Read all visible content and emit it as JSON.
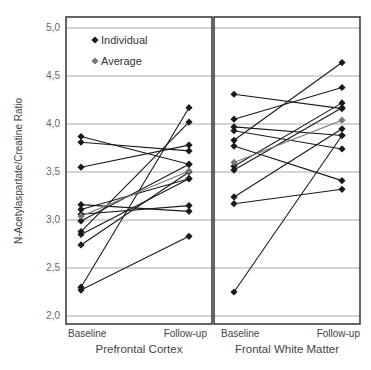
{
  "chart_data": {
    "type": "line",
    "ylabel": "N-Acetylaspartate/Creatine Ratio",
    "ylim": [
      1.95,
      5.1
    ],
    "yticks": [
      "5,0",
      "4,5",
      "4,0",
      "3,5",
      "3,0",
      "2,5",
      "2,0"
    ],
    "ytick_values": [
      5.0,
      4.5,
      4.0,
      3.5,
      3.0,
      2.5,
      2.0
    ],
    "grid": true,
    "legend": {
      "position": "upper-left",
      "entries": [
        {
          "label": "Individual",
          "color": "#1a1a1a"
        },
        {
          "label": "Average",
          "color": "#777777"
        }
      ]
    },
    "panels": [
      {
        "title": "Prefrontal Cortex",
        "categories": [
          "Baseline",
          "Follow-up"
        ],
        "individuals": [
          [
            3.87,
            3.58
          ],
          [
            3.81,
            3.72
          ],
          [
            3.55,
            3.78
          ],
          [
            3.16,
            3.09
          ],
          [
            3.11,
            3.43
          ],
          [
            3.06,
            3.15
          ],
          [
            2.99,
            3.58
          ],
          [
            2.88,
            4.02
          ],
          [
            2.85,
            3.43
          ],
          [
            2.74,
            3.5
          ],
          [
            2.3,
            4.17
          ],
          [
            2.27,
            2.83
          ]
        ],
        "average": [
          3.04,
          3.51
        ]
      },
      {
        "title": "Frontal White Matter",
        "categories": [
          "Baseline",
          "Follow-up"
        ],
        "individuals": [
          [
            4.31,
            4.16
          ],
          [
            4.05,
            4.38
          ],
          [
            3.97,
            3.88
          ],
          [
            3.93,
            3.74
          ],
          [
            3.83,
            4.64
          ],
          [
            3.77,
            3.41
          ],
          [
            3.56,
            4.22
          ],
          [
            3.52,
            4.17
          ],
          [
            3.24,
            3.95
          ],
          [
            3.17,
            3.32
          ],
          [
            2.25,
            3.88
          ]
        ],
        "average": [
          3.6,
          4.04
        ]
      }
    ]
  },
  "colors": {
    "individual": "#1a1a1a",
    "average": "#777777",
    "grid": "#aaaaaa",
    "frame": "#333333"
  }
}
